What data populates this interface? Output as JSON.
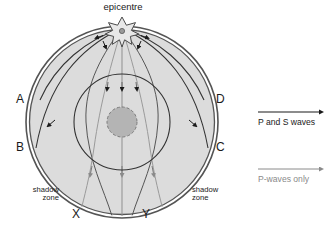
{
  "diagram": {
    "title_label": "epicentre",
    "epicentre_icon": "star-burst-icon",
    "surface_points": [
      {
        "id": "A",
        "label": "A"
      },
      {
        "id": "B",
        "label": "B"
      },
      {
        "id": "C",
        "label": "C"
      },
      {
        "id": "D",
        "label": "D"
      },
      {
        "id": "X",
        "label": "X"
      },
      {
        "id": "Y",
        "label": "Y"
      }
    ],
    "shadow_zone_left": "shadow\nzone",
    "shadow_zone_right": "shadow\nzone",
    "layers": {
      "mantle_fill": "#dcdcdc",
      "crust_stroke": "#4d4d4d",
      "outer_core_stroke": "#333333",
      "inner_core_fill": "#b4b4b4",
      "inner_core_stroke": "#808080"
    }
  },
  "legend": {
    "items": [
      {
        "label": "P and S waves",
        "color": "#1a1a1a",
        "arrow": "arrow-right-icon"
      },
      {
        "label": "P-waves only",
        "color": "#8a8a8a",
        "arrow": "arrow-right-icon"
      }
    ],
    "ps_label": "P and S waves",
    "ponly_label": "P-waves only"
  }
}
